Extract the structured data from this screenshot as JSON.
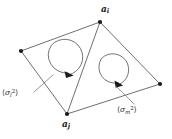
{
  "figure": {
    "type": "lattice-plaquette-diagram",
    "background_color": "#ffffff",
    "line_color": "#4a4a4a",
    "node_color": "#1a1a1a",
    "width": 172,
    "height": 139
  },
  "nodes": [
    {
      "id": "top",
      "name": "a_i",
      "label": "a",
      "subscript": "i",
      "x": 100,
      "y": 22
    },
    {
      "id": "left",
      "name": "unlabeled-left",
      "label": "",
      "subscript": "",
      "x": 21,
      "y": 51
    },
    {
      "id": "bottom",
      "name": "a_j",
      "label": "a",
      "subscript": "j",
      "x": 67,
      "y": 114
    },
    {
      "id": "right",
      "name": "unlabeled-right",
      "label": "",
      "subscript": "",
      "x": 160,
      "y": 84
    }
  ],
  "edges": [
    {
      "from": "left",
      "to": "top"
    },
    {
      "from": "top",
      "to": "right"
    },
    {
      "from": "right",
      "to": "bottom"
    },
    {
      "from": "bottom",
      "to": "left"
    }
  ],
  "diagonal": {
    "from": "top",
    "to": "bottom"
  },
  "circulations": [
    {
      "id": "left-loop",
      "name": "circulation-arrow-left",
      "center_x": 60,
      "center_y": 60,
      "radius": 18,
      "direction": "clockwise",
      "arrow_angle_deg": 62
    },
    {
      "id": "right-loop",
      "name": "circulation-arrow-right",
      "center_x": 109,
      "center_y": 72,
      "radius": 16,
      "direction": "clockwise",
      "arrow_angle_deg": 52
    }
  ],
  "annotations": [
    {
      "id": "variance-l",
      "name": "variance-label-l",
      "text": "⟨σₗ²⟩",
      "bracket_open": "⟨",
      "symbol": "σ",
      "subscript": "l",
      "superscript": "2",
      "bracket_close": "⟩",
      "x": 2,
      "y": 89,
      "leader": {
        "x1": 34,
        "y1": 91,
        "x2": 52,
        "y2": 76
      }
    },
    {
      "id": "variance-m",
      "name": "variance-label-m",
      "text": "⟨σₘ²⟩",
      "bracket_open": "⟨",
      "symbol": "σ",
      "subscript": "m",
      "superscript": "2",
      "bracket_close": "⟩",
      "x": 117,
      "y": 106,
      "leader": {
        "x1": 134,
        "y1": 104,
        "x2": 116,
        "y2": 86
      }
    }
  ]
}
